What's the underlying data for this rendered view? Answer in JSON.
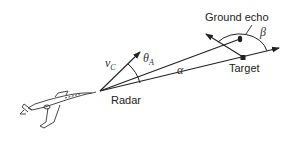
{
  "labels": {
    "ground_echo": "Ground echo",
    "target": "Target",
    "radar": "Radar",
    "vc_main": "v",
    "vc_sub": "C",
    "theta_main": "θ",
    "theta_sub": "A",
    "alpha": "α",
    "beta": "β"
  },
  "colors": {
    "stroke": "#222222",
    "background": "#ffffff"
  }
}
